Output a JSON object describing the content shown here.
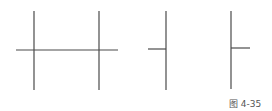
{
  "figure": {
    "caption": "图 4-35",
    "line_color": "#4a4a4a",
    "panels": [
      {
        "name": "double-vertical-with-crossbar",
        "verticals": [
          34,
          99
        ],
        "crossbar": {
          "x1": 16,
          "x2": 118,
          "y": 50
        }
      },
      {
        "name": "vertical-with-left-stub",
        "verticals": [
          166
        ],
        "stub": {
          "x1": 148,
          "x2": 166,
          "y": 49
        }
      },
      {
        "name": "vertical-with-right-stub",
        "verticals": [
          231
        ],
        "stub": {
          "x1": 231,
          "x2": 250,
          "y": 48
        }
      }
    ]
  }
}
